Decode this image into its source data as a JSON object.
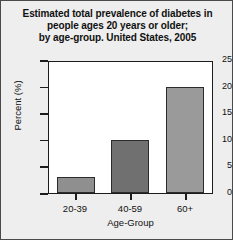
{
  "chart_data": {
    "type": "bar",
    "title": "Estimated total prevalence of diabetes in people ages 20 years or older; by age-group. United States, 2005",
    "title_lines": [
      "Estimated total prevalence of diabetes in",
      "people ages 20 years or older;",
      "by age-group. United States, 2005"
    ],
    "categories": [
      "20-39",
      "40-59",
      "60+"
    ],
    "values": [
      3,
      10,
      20
    ],
    "xlabel": "Age-Group",
    "ylabel": "Percent (%)",
    "ylim": [
      0,
      25
    ],
    "yticks": [
      0,
      5,
      10,
      15,
      20,
      25
    ],
    "ytick_labels": [
      "0",
      "5",
      "10",
      "15",
      "20",
      "25"
    ],
    "grid": false,
    "legend": false,
    "bar_colors": [
      "#8f8f8f",
      "#707070",
      "#9a9a9a"
    ],
    "bar_edge_color": "#2b2b2b",
    "background_color": "#eeeeee",
    "plot_background_color": "#ffffff",
    "axis_color": "#1c1c1c"
  }
}
